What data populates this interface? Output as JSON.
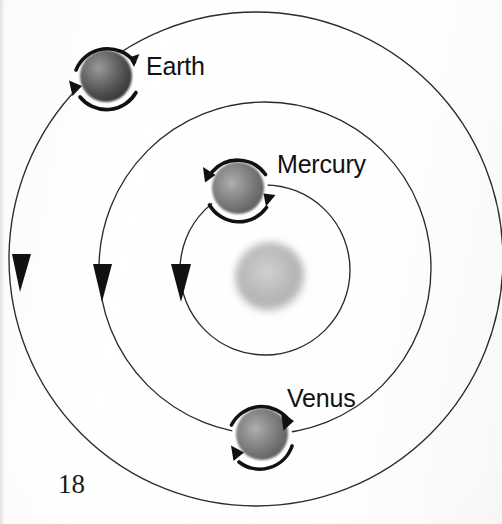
{
  "page": {
    "number": "18",
    "kind": "textbook-figure",
    "background_color": "#fdfdfc",
    "ink_color": "#1a1a1a"
  },
  "figure": {
    "title_visible": false,
    "center_body": {
      "name": "Sun",
      "label_shown": "",
      "cx": 270,
      "cy": 277,
      "r": 35,
      "fill_color": "#b9b9b9",
      "style": "soft fuzzy light-gray sphere"
    },
    "orbits": [
      {
        "id": "mercury-orbit",
        "label": "Mercury orbit",
        "cx": 265,
        "cy": 270,
        "r": 85,
        "stroke_color": "#2b2b2b",
        "stroke_width": 1.3,
        "direction": "counterclockwise",
        "direction_arrow": {
          "x": 181,
          "y": 284,
          "angle_deg": 186
        }
      },
      {
        "id": "venus-orbit",
        "label": "Venus orbit",
        "cx": 265,
        "cy": 268,
        "r": 166,
        "stroke_color": "#2b2b2b",
        "stroke_width": 1.3,
        "direction": "counterclockwise",
        "direction_arrow": {
          "x": 101,
          "y": 284,
          "angle_deg": 188
        }
      },
      {
        "id": "earth-orbit",
        "label": "Earth orbit",
        "cx": 256,
        "cy": 259,
        "r": 247,
        "stroke_color": "#2b2b2b",
        "stroke_width": 1.3,
        "direction": "counterclockwise",
        "direction_arrow": {
          "x": 21,
          "y": 274,
          "angle_deg": 188
        }
      }
    ],
    "planets": [
      {
        "id": "mercury",
        "label": "Mercury",
        "cx": 238,
        "cy": 188,
        "r": 26,
        "fill_color": "#6e6e6e",
        "rotation": "counterclockwise",
        "rotation_arc_radius": 34,
        "label_x": 277,
        "label_y": 150
      },
      {
        "id": "venus",
        "label": "Venus",
        "cx": 262,
        "cy": 434,
        "r": 26,
        "fill_color": "#6e6e6e",
        "rotation": "clockwise",
        "rotation_arc_radius": 34,
        "label_x": 287,
        "label_y": 384
      },
      {
        "id": "earth",
        "label": "Earth",
        "cx": 106,
        "cy": 76,
        "r": 26,
        "fill_color": "#4a4a4a",
        "rotation": "counterclockwise",
        "rotation_arc_radius": 34,
        "label_x": 146,
        "label_y": 52
      }
    ],
    "icons": {
      "orbit_direction_arrow": "arrowhead-icon",
      "rotation_arc_arrow": "curved-arrow-icon",
      "sun": "sun-icon",
      "planet_sphere": "sphere-icon"
    }
  }
}
